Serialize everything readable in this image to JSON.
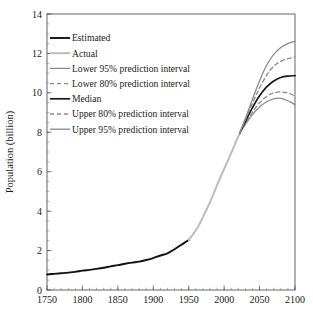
{
  "chart_data": {
    "type": "line",
    "title": "",
    "xlabel": "",
    "ylabel": "Population (billion)",
    "xlim": [
      1750,
      2100
    ],
    "ylim": [
      0,
      14
    ],
    "xticks": [
      1750,
      1800,
      1850,
      1900,
      1950,
      2000,
      2050,
      2100
    ],
    "yticks": [
      0,
      2,
      4,
      6,
      8,
      10,
      12,
      14
    ],
    "xtick_labels": [
      "1750",
      "1800",
      "1850",
      "1900",
      "1950",
      "2000",
      "2050",
      "2100"
    ],
    "ytick_labels": [
      "0",
      "2",
      "4",
      "6",
      "8",
      "10",
      "12",
      "14"
    ],
    "x_minor_step": 10,
    "y_minor_step": 0.5,
    "grid": false,
    "legend_position": "upper-left",
    "series": [
      {
        "name": "Estimated",
        "color": "#111111",
        "width": 1.9,
        "dash": "none",
        "x": [
          1750,
          1760,
          1770,
          1780,
          1790,
          1800,
          1810,
          1820,
          1830,
          1840,
          1850,
          1860,
          1870,
          1880,
          1890,
          1900,
          1910,
          1920,
          1930,
          1940,
          1950
        ],
        "values": [
          0.79,
          0.82,
          0.85,
          0.88,
          0.92,
          0.98,
          1.02,
          1.07,
          1.13,
          1.2,
          1.26,
          1.33,
          1.39,
          1.44,
          1.52,
          1.62,
          1.75,
          1.86,
          2.07,
          2.3,
          2.54
        ]
      },
      {
        "name": "Actual",
        "color": "#b9b9b9",
        "width": 1.9,
        "dash": "none",
        "x": [
          1950,
          1955,
          1960,
          1965,
          1970,
          1975,
          1980,
          1985,
          1990,
          1995,
          2000,
          2005,
          2010,
          2015,
          2020,
          2022
        ],
        "values": [
          2.54,
          2.77,
          3.03,
          3.33,
          3.7,
          4.07,
          4.45,
          4.87,
          5.32,
          5.74,
          6.14,
          6.54,
          6.96,
          7.38,
          7.79,
          7.95
        ]
      },
      {
        "name": "Lower 95% prediction interval",
        "color": "#8a8a8a",
        "width": 1.3,
        "dash": "none",
        "x": [
          2022,
          2030,
          2040,
          2050,
          2060,
          2070,
          2080,
          2090,
          2100
        ],
        "values": [
          7.95,
          8.4,
          8.9,
          9.28,
          9.55,
          9.7,
          9.72,
          9.6,
          9.4
        ]
      },
      {
        "name": "Lower 80% prediction interval",
        "color": "#8a8a8a",
        "width": 1.3,
        "dash": "4,3",
        "x": [
          2022,
          2030,
          2040,
          2050,
          2060,
          2070,
          2080,
          2090,
          2100
        ],
        "values": [
          7.95,
          8.45,
          9.02,
          9.5,
          9.82,
          10.0,
          10.05,
          9.98,
          9.85
        ]
      },
      {
        "name": "Median",
        "color": "#1a1a1a",
        "width": 1.7,
        "dash": "none",
        "x": [
          2022,
          2030,
          2040,
          2050,
          2060,
          2070,
          2080,
          2090,
          2100
        ],
        "values": [
          7.95,
          8.55,
          9.25,
          9.85,
          10.3,
          10.6,
          10.78,
          10.85,
          10.87
        ]
      },
      {
        "name": "Upper 80% prediction interval",
        "color": "#8a8a8a",
        "width": 1.3,
        "dash": "4,3",
        "x": [
          2022,
          2030,
          2040,
          2050,
          2060,
          2070,
          2080,
          2090,
          2100
        ],
        "values": [
          7.95,
          8.63,
          9.48,
          10.25,
          10.9,
          11.35,
          11.6,
          11.74,
          11.82
        ]
      },
      {
        "name": "Upper 95% prediction interval",
        "color": "#8a8a8a",
        "width": 1.3,
        "dash": "none",
        "x": [
          2022,
          2030,
          2040,
          2050,
          2060,
          2070,
          2080,
          2090,
          2100
        ],
        "values": [
          7.95,
          8.7,
          9.68,
          10.62,
          11.4,
          11.95,
          12.3,
          12.5,
          12.62
        ]
      }
    ],
    "legend": [
      {
        "label": "Estimated",
        "color": "#111111",
        "width": 1.9,
        "dash": "none"
      },
      {
        "label": "Actual",
        "color": "#b9b9b9",
        "width": 1.9,
        "dash": "none"
      },
      {
        "label": "Lower 95% prediction interval",
        "color": "#8a8a8a",
        "width": 1.3,
        "dash": "none"
      },
      {
        "label": "Lower 80% prediction interval",
        "color": "#8a8a8a",
        "width": 1.3,
        "dash": "4,3"
      },
      {
        "label": "Median",
        "color": "#1a1a1a",
        "width": 1.7,
        "dash": "none"
      },
      {
        "label": "Upper 80% prediction interval",
        "color": "#8a8a8a",
        "width": 1.3,
        "dash": "4,3"
      },
      {
        "label": "Upper 95% prediction interval",
        "color": "#8a8a8a",
        "width": 1.3,
        "dash": "none"
      }
    ]
  },
  "layout": {
    "plot_left": 47,
    "plot_right": 295,
    "plot_top": 14,
    "plot_bottom": 290,
    "legend_x": 50,
    "legend_y": 38,
    "legend_row_height": 15.2,
    "legend_swatch_width": 20
  }
}
